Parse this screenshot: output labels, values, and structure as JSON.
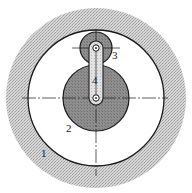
{
  "diagram": {
    "type": "planetary gear mechanism",
    "colors": {
      "background": "#ffffff",
      "ring_stipple": "#c8c8c8",
      "ring_inner": "#ffffff",
      "sun_gear": "#8e8e8e",
      "planet_gear": "#9a9a9a",
      "carrier_arm": "#dcdcdc",
      "outline": "#1a1a1a"
    },
    "parts": [
      {
        "id": "1",
        "label": "1",
        "name": "ring gear"
      },
      {
        "id": "2",
        "label": "2",
        "name": "sun gear"
      },
      {
        "id": "3",
        "label": "3",
        "name": "planet gear"
      },
      {
        "id": "4",
        "label": "4",
        "name": "carrier arm"
      }
    ]
  }
}
